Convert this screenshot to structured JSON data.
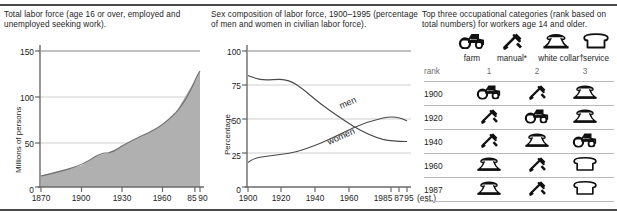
{
  "figure": {
    "panels": {
      "labor_force": {
        "caption": "Total labor force (age 16 or over, employed and unemployed seeking work).",
        "ylabel": "Millions of persons",
        "yticks": [
          "150",
          "100",
          "50",
          "0"
        ],
        "xticks": [
          "1870",
          "1900",
          "1930",
          "1960",
          "85",
          "90"
        ]
      },
      "sex_composition": {
        "caption": "Sex composition of labor force, 1900–1995 (percentage of men and women in civilian labor force).",
        "ylabel": "Percentage",
        "yticks": [
          "100",
          "75",
          "50",
          "25",
          "0"
        ],
        "xticks": [
          "1900",
          "1920",
          "1940",
          "1960",
          "1985",
          "87",
          "95"
        ],
        "est_note": "(est.)",
        "series_labels": {
          "men": "men",
          "women": "women"
        }
      },
      "occupations": {
        "caption": "Top three occupational categories (rank based on total numbers) for workers age 14 and older.",
        "legend": [
          {
            "icon": "tractor-icon",
            "label": "farm"
          },
          {
            "icon": "wrench-icon",
            "label": "manual*"
          },
          {
            "icon": "telephone-icon",
            "label": "white collar†"
          },
          {
            "icon": "bread-icon",
            "label": "service"
          }
        ],
        "rank_row_label": "rank",
        "rank_numbers": [
          "1",
          "2",
          "3"
        ],
        "rows": [
          {
            "year": "1900",
            "icons": [
              "tractor-icon",
              "wrench-icon",
              "telephone-icon"
            ]
          },
          {
            "year": "1920",
            "icons": [
              "wrench-icon",
              "tractor-icon",
              "telephone-icon"
            ]
          },
          {
            "year": "1940",
            "icons": [
              "wrench-icon",
              "telephone-icon",
              "tractor-icon"
            ]
          },
          {
            "year": "1960",
            "icons": [
              "telephone-icon",
              "wrench-icon",
              "bread-icon"
            ]
          },
          {
            "year": "1987",
            "icons": [
              "telephone-icon",
              "wrench-icon",
              "bread-icon"
            ]
          }
        ]
      }
    },
    "colors": {
      "ink": "#1b1b1b",
      "area_fill": "#b0b0b0",
      "gridline": "#cfcfcf",
      "axis": "#6a6a6a",
      "rule": "#4a4a4a"
    }
  },
  "chart_data": [
    {
      "type": "area",
      "title": "Total labor force (age 16 or over, employed and unemployed seeking work).",
      "xlabel": "",
      "ylabel": "Millions of persons",
      "xlim": [
        1870,
        1990
      ],
      "ylim": [
        0,
        150
      ],
      "grid": true,
      "legend": "none",
      "xticklabels": [
        "1870",
        "1900",
        "1930",
        "1960",
        "85",
        "90"
      ],
      "xtickvalues": [
        1870,
        1900,
        1930,
        1960,
        1985,
        1990
      ],
      "yticklabels": [
        "0",
        "50",
        "100",
        "150"
      ],
      "x": [
        1870,
        1880,
        1890,
        1900,
        1910,
        1920,
        1930,
        1940,
        1950,
        1960,
        1970,
        1980,
        1985,
        1990
      ],
      "values": [
        13,
        17,
        22,
        28,
        37,
        41,
        48,
        55,
        62,
        70,
        83,
        107,
        116,
        126
      ]
    },
    {
      "type": "line",
      "title": "Sex composition of labor force, 1900–1995 (percentage of men and women in civilian labor force).",
      "xlabel": "",
      "ylabel": "Percentage",
      "xlim": [
        1900,
        1995
      ],
      "ylim": [
        0,
        100
      ],
      "grid": true,
      "legend": "inline-labels",
      "xticklabels": [
        "1900",
        "1920",
        "1940",
        "1960",
        "1985",
        "87",
        "95"
      ],
      "xtickvalues": [
        1900,
        1920,
        1940,
        1960,
        1985,
        1987,
        1995
      ],
      "yticklabels": [
        "0",
        "25",
        "50",
        "75",
        "100"
      ],
      "annotations": [
        "(est.)"
      ],
      "x": [
        1900,
        1910,
        1920,
        1930,
        1940,
        1950,
        1960,
        1970,
        1980,
        1985,
        1990,
        1995
      ],
      "series": [
        {
          "name": "men",
          "values": [
            82,
            79,
            80,
            78,
            75,
            71,
            67,
            62,
            58,
            55,
            54,
            54
          ]
        },
        {
          "name": "women",
          "values": [
            18,
            21,
            22,
            23,
            25,
            28,
            33,
            38,
            43,
            45,
            47,
            49
          ]
        }
      ]
    },
    {
      "type": "table",
      "title": "Top three occupational categories (rank based on total numbers) for workers age 14 and older.",
      "columns": [
        "rank",
        "1",
        "2",
        "3"
      ],
      "rows": [
        [
          "1900",
          "farm",
          "manual*",
          "white collar†"
        ],
        [
          "1920",
          "manual*",
          "farm",
          "white collar†"
        ],
        [
          "1940",
          "manual*",
          "white collar†",
          "farm"
        ],
        [
          "1960",
          "white collar†",
          "manual*",
          "service"
        ],
        [
          "1987",
          "white collar†",
          "manual*",
          "service"
        ]
      ],
      "legend_categories": [
        "farm",
        "manual*",
        "white collar†",
        "service"
      ]
    }
  ]
}
